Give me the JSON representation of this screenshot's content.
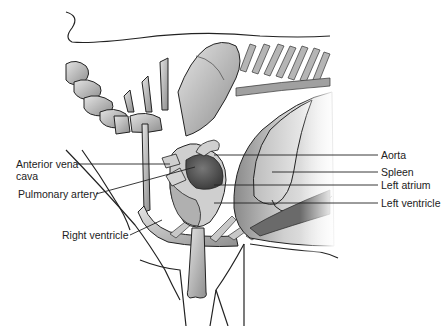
{
  "figure": {
    "labels_left": [
      {
        "id": "anterior-vena-cava",
        "text_line1": "Anterior vena",
        "text_line2": "cava"
      },
      {
        "id": "pulmonary-artery",
        "text": "Pulmonary artery"
      },
      {
        "id": "right-ventricle",
        "text": "Right ventricle"
      }
    ],
    "labels_right": [
      {
        "id": "aorta",
        "text": "Aorta"
      },
      {
        "id": "spleen",
        "text": "Spleen"
      },
      {
        "id": "left-atrium",
        "text": "Left atrium"
      },
      {
        "id": "left-ventricle",
        "text": "Left ventricle"
      }
    ]
  },
  "colors": {
    "outline": "#222222",
    "bone_light": "#d8d8d8",
    "bone_mid": "#a8a8a8",
    "organ_dark": "#6a6a6a",
    "background": "#ffffff"
  }
}
